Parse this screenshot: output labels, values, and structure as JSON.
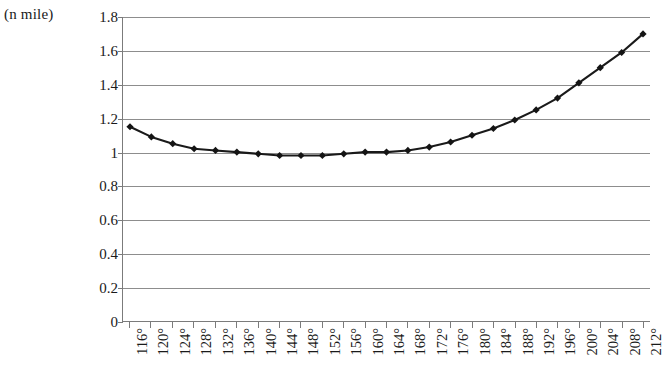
{
  "axes": {
    "y_unit_label": "(n mile)",
    "y_ticks": [
      "0",
      "0.2",
      "0.4",
      "0.6",
      "0.8",
      "1",
      "1.2",
      "1.4",
      "1.6",
      "1.8"
    ],
    "x_ticks": [
      "116°",
      "120°",
      "124°",
      "128°",
      "132°",
      "136°",
      "140°",
      "144°",
      "148°",
      "152°",
      "156°",
      "160°",
      "164°",
      "168°",
      "172°",
      "176°",
      "180°",
      "184°",
      "188°",
      "192°",
      "196°",
      "200°",
      "204°",
      "208°",
      "212°"
    ]
  },
  "style": {
    "line_color": "#1a1a1a",
    "marker_color": "#141414",
    "grid_color": "#8d8d8d",
    "axis_color": "#7b7b7b"
  },
  "chart_data": {
    "type": "line",
    "title": "",
    "subtitle": "",
    "xlabel": "",
    "ylabel": "(n mile)",
    "grid": true,
    "legend": "none",
    "marker": "diamond",
    "xlim": [
      116,
      212
    ],
    "ylim": [
      0,
      1.8
    ],
    "ytick_step": 0.2,
    "xtick_step": 4,
    "categories": [
      "116°",
      "120°",
      "124°",
      "128°",
      "132°",
      "136°",
      "140°",
      "144°",
      "148°",
      "152°",
      "156°",
      "160°",
      "164°",
      "168°",
      "172°",
      "176°",
      "180°",
      "184°",
      "188°",
      "192°",
      "196°",
      "200°",
      "204°",
      "208°",
      "212°"
    ],
    "x": [
      116,
      120,
      124,
      128,
      132,
      136,
      140,
      144,
      148,
      152,
      156,
      160,
      164,
      168,
      172,
      176,
      180,
      184,
      188,
      192,
      196,
      200,
      204,
      208,
      212
    ],
    "values": [
      1.15,
      1.09,
      1.05,
      1.02,
      1.01,
      1.0,
      0.99,
      0.98,
      0.98,
      0.98,
      0.99,
      1.0,
      1.0,
      1.01,
      1.03,
      1.06,
      1.1,
      1.14,
      1.19,
      1.25,
      1.32,
      1.41,
      1.5,
      1.59,
      1.7
    ],
    "series": [
      {
        "name": "distance",
        "values": [
          1.15,
          1.09,
          1.05,
          1.02,
          1.01,
          1.0,
          0.99,
          0.98,
          0.98,
          0.98,
          0.99,
          1.0,
          1.0,
          1.01,
          1.03,
          1.06,
          1.1,
          1.14,
          1.19,
          1.25,
          1.32,
          1.41,
          1.5,
          1.59,
          1.7
        ]
      }
    ]
  }
}
